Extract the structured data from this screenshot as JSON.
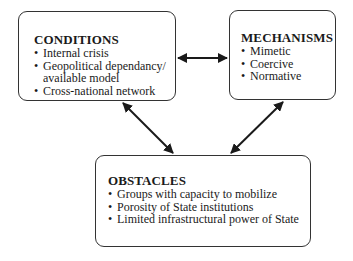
{
  "diagram": {
    "conditions": {
      "title": "CONDITIONS",
      "items": [
        "Internal crisis",
        "Geopolitical dependancy/",
        "Cross-national network"
      ],
      "continuation": "available model"
    },
    "mechanisms": {
      "title": "MECHANISMS",
      "items": [
        "Mimetic",
        "Coercive",
        "Normative"
      ]
    },
    "obstacles": {
      "title": "OBSTACLES",
      "items": [
        "Groups with capacity to mobilize",
        "Porosity of State institutions",
        "Limited infrastructural power of State"
      ]
    },
    "arrows": [
      {
        "from": "conditions",
        "to": "mechanisms",
        "type": "bidirectional"
      },
      {
        "from": "conditions",
        "to": "obstacles",
        "type": "bidirectional"
      },
      {
        "from": "mechanisms",
        "to": "obstacles",
        "type": "bidirectional"
      }
    ],
    "colors": {
      "stroke": "#1a1a1a",
      "background": "#ffffff"
    }
  }
}
